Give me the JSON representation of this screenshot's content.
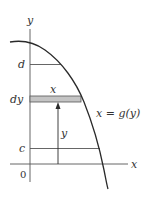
{
  "figure": {
    "colors": {
      "ink": "#2a2a2a",
      "axis": "#555555",
      "strip_fill": "#c4c4c4",
      "strip_stroke": "#555555",
      "label": "#333333"
    },
    "axes": {
      "x_label": "x",
      "y_label": "y",
      "origin_label": "0"
    },
    "bounds": {
      "upper_label": "d",
      "lower_label": "c"
    },
    "strip": {
      "width_label": "x",
      "thickness_label": "dy"
    },
    "arrow": {
      "label": "y"
    },
    "curve": {
      "equation_label": "x = g(y)"
    }
  }
}
